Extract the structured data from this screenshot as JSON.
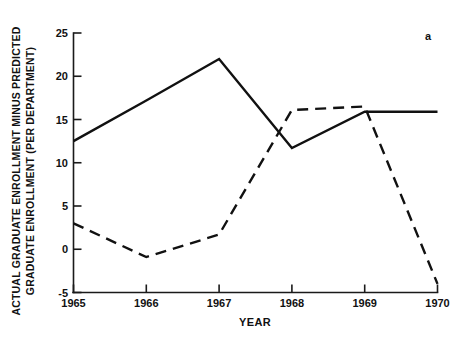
{
  "chart_data": {
    "type": "line",
    "title": "",
    "panel_label": "a",
    "xlabel": "YEAR",
    "ylabel_line1": "ACTUAL GRADUATE ENROLLMENT MINUS PREDICTED",
    "ylabel_line2": "GRADUATE ENROLLMENT (PER DEPARTMENT)",
    "x": [
      1965,
      1966,
      1967,
      1968,
      1969,
      1970
    ],
    "xtick_labels": [
      "1965",
      "1966",
      "1967",
      "1968",
      "1969",
      "1970"
    ],
    "ytick_labels": [
      "25",
      "20",
      "15",
      "10",
      "5",
      "0",
      "-5"
    ],
    "yticks": [
      25,
      20,
      15,
      10,
      5,
      0,
      -5
    ],
    "xlim": [
      1965,
      1970
    ],
    "ylim": [
      -5,
      25
    ],
    "grid": false,
    "legend": "none",
    "series": [
      {
        "name": "solid-series",
        "style": "solid",
        "color": "#111111",
        "values": [
          12.5,
          17.2,
          22.0,
          11.7,
          15.9,
          15.9
        ]
      },
      {
        "name": "dashed-series",
        "style": "dashed",
        "color": "#111111",
        "values": [
          3.0,
          -0.9,
          1.7,
          16.1,
          16.5,
          -4.0
        ]
      }
    ]
  }
}
